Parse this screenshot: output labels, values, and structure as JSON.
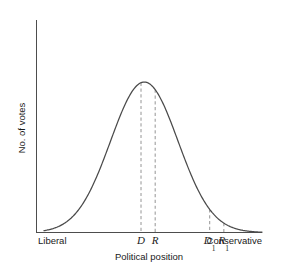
{
  "chart_data": {
    "type": "line",
    "title": "",
    "xlabel": "Political position",
    "ylabel": "No. of votes",
    "xlim": [
      0,
      100
    ],
    "ylim": [
      0,
      100
    ],
    "grid": false,
    "legend": null,
    "distribution": {
      "shape": "normal-bell-curve",
      "mean": 46,
      "std_dev": 15.5,
      "peak_value": 100
    },
    "x_axis_end_labels": {
      "left": "Liberal",
      "right": "Conservative"
    },
    "annotations": [
      {
        "id": "D",
        "label": "D",
        "sub": "",
        "x": 44.5,
        "y": 99.0
      },
      {
        "id": "R",
        "label": "R",
        "sub": "",
        "x": 51.0,
        "y": 99.2
      },
      {
        "id": "D1",
        "label": "D",
        "sub": "1",
        "x": 76.0,
        "y": 57.5
      },
      {
        "id": "R1",
        "label": "R",
        "sub": "1",
        "x": 82.5,
        "y": 42.0
      }
    ],
    "series": [
      {
        "name": "No. of votes",
        "x": [
          0,
          5,
          10,
          15,
          20,
          25,
          30,
          35,
          40,
          46,
          50,
          55,
          60,
          65,
          70,
          75,
          80,
          85,
          90,
          95,
          100
        ],
        "values": [
          1.1,
          2.3,
          4.4,
          8.0,
          13.8,
          22.3,
          33.9,
          48.0,
          63.0,
          100.0,
          94.2,
          83.0,
          68.2,
          52.0,
          37.0,
          24.7,
          15.4,
          9.0,
          4.9,
          2.5,
          1.2
        ]
      }
    ]
  },
  "axes": {
    "y_axis_label": "No. of votes",
    "x_axis_label": "Political position",
    "left_end_label": "Liberal",
    "right_end_label": "Conservative"
  },
  "markers": {
    "d_label": "D",
    "r_label": "R",
    "d1_label": "D",
    "d1_sub": "1",
    "r1_label": "R",
    "r1_sub": "1"
  },
  "colors": {
    "axis": "#4d4d4d",
    "curve": "#4a4a4a",
    "marker": "#9a9a9a",
    "text": "#1a1a1a",
    "background": "#ffffff"
  }
}
